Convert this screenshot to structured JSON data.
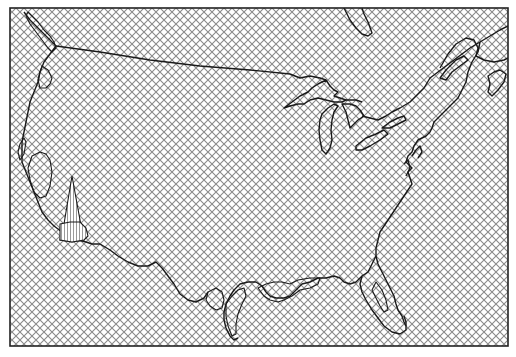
{
  "map": {
    "title": "",
    "region": "Contiguous United States",
    "style": {
      "background": "#ffffff",
      "hatch_color": "#8a8a8a",
      "outline_color": "#1a1a1a",
      "frame_color": "#222222",
      "hatch_spacing_px": 8,
      "hatch_type": "diagonal-crosshatch"
    },
    "frame": {
      "x": 10,
      "y": 8,
      "width": 498,
      "height": 338
    },
    "features": [
      {
        "id": "us-coastline-and-border",
        "type": "outline"
      },
      {
        "id": "great-lakes",
        "type": "outline"
      },
      {
        "id": "puget-sound-region",
        "type": "outline-region"
      },
      {
        "id": "oregon-coast-region",
        "type": "outline-region"
      },
      {
        "id": "california-coast-region",
        "type": "outline-region"
      },
      {
        "id": "southern-california-vertical-hatch-region",
        "type": "vertical-hatch-region"
      },
      {
        "id": "gulf-coast-louisiana-region",
        "type": "outline-region"
      },
      {
        "id": "texas-coast-region",
        "type": "outline-region"
      },
      {
        "id": "florida-panhandle-region",
        "type": "outline-region"
      },
      {
        "id": "chesapeake-region",
        "type": "outline-region"
      },
      {
        "id": "hudson-bay-edge",
        "type": "outline"
      },
      {
        "id": "gulf-of-st-lawrence",
        "type": "outline"
      }
    ]
  }
}
